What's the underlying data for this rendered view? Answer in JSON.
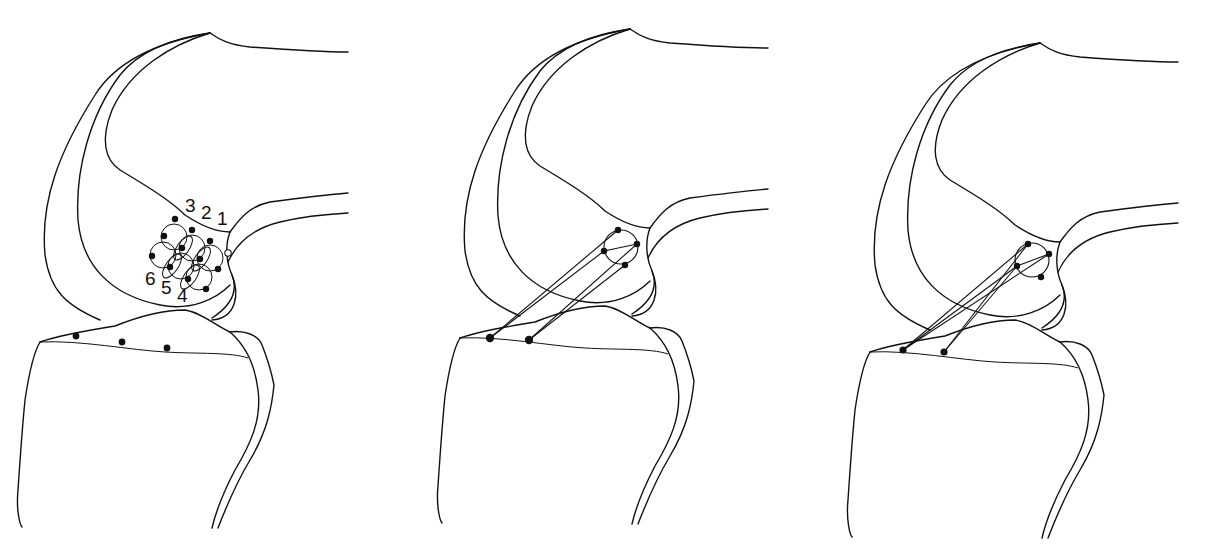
{
  "figure": {
    "colors": {
      "line": "#111111",
      "background": "#ffffff"
    },
    "panels": [
      {
        "id": "panel-1",
        "label_numbers_top": [
          "3",
          "2",
          "1"
        ],
        "label_numbers_bottom": [
          "6",
          "5",
          "4"
        ],
        "femoral_grid_points": 11,
        "open_marker": 1,
        "tibial_points": 3
      },
      {
        "id": "panel-2",
        "femoral_circle_points": 4,
        "tibial_points": 2,
        "ligament_lines": 4
      },
      {
        "id": "panel-3",
        "femoral_circle_points": 4,
        "tibial_points": 2,
        "ligament_lines": 4
      }
    ]
  }
}
